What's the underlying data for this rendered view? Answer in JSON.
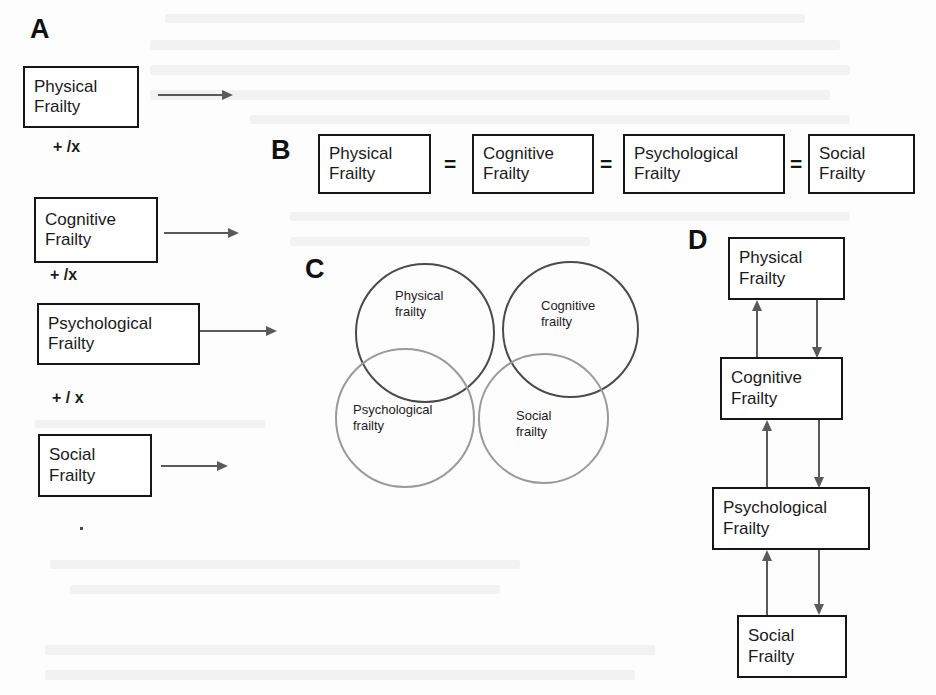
{
  "figure": {
    "background_color": "#fdfdfd",
    "dark_stroke": "#161616",
    "gray_stroke": "#8e8e8e",
    "arrow_color": "#5a5a5a"
  },
  "panel_a": {
    "letter": "A",
    "description": "Sequential / additive model with + /x operators between domains",
    "boxes": [
      {
        "line1": "Physical",
        "line2": "Frailty"
      },
      {
        "line1": "Cognitive",
        "line2": "Frailty"
      },
      {
        "line1": "Psychological",
        "line2": "Frailty"
      },
      {
        "line1": "Social",
        "line2": "Frailty"
      }
    ],
    "operators": [
      "+ /x",
      "+ /x",
      "+ / x"
    ],
    "arrow_count": 4
  },
  "panel_b": {
    "letter": "B",
    "description": "Equivalence model: all frailty domains joined by equals signs",
    "boxes": [
      {
        "line1": "Physical",
        "line2": "Frailty"
      },
      {
        "line1": "Cognitive",
        "line2": "Frailty"
      },
      {
        "line1": "Psychological",
        "line2": "Frailty"
      },
      {
        "line1": "Social",
        "line2": "Frailty"
      }
    ],
    "separators": [
      "=",
      "=",
      "="
    ]
  },
  "panel_c": {
    "letter": "C",
    "description": "Venn diagram of four overlapping frailty domains",
    "circles": [
      {
        "line1": "Physical",
        "line2": "frailty",
        "color": "#4a4a4a"
      },
      {
        "line1": "Cognitive",
        "line2": "frailty",
        "color": "#4a4a4a"
      },
      {
        "line1": "Psychological",
        "line2": "frailty",
        "color": "#9a9a9a"
      },
      {
        "line1": "Social",
        "line2": "frailty",
        "color": "#9a9a9a"
      }
    ]
  },
  "panel_d": {
    "letter": "D",
    "description": "Hierarchical cascade model with bidirectional arrows between adjacent domains",
    "boxes": [
      {
        "line1": "Physical",
        "line2": "Frailty"
      },
      {
        "line1": "Cognitive",
        "line2": "Frailty"
      },
      {
        "line1": "Psychological",
        "line2": "Frailty"
      },
      {
        "line1": "Social",
        "line2": "Frailty"
      }
    ],
    "arrow_pairs": 3
  }
}
